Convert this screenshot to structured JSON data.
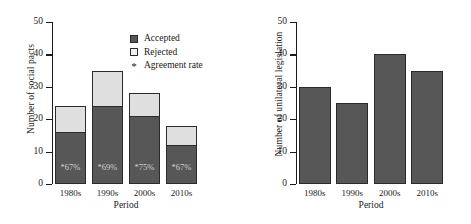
{
  "chart_data": [
    {
      "type": "bar",
      "panel": "left",
      "title": "",
      "xlabel": "Period",
      "ylabel": "Number of social pacts",
      "categories": [
        "1980s",
        "1990s",
        "2000s",
        "2010s"
      ],
      "ylim": [
        0,
        50
      ],
      "yticks": [
        0,
        10,
        20,
        30,
        40,
        50
      ],
      "ytick_labels": [
        "0",
        "10",
        "20",
        "30",
        "40",
        "50"
      ],
      "grid": false,
      "stacked": true,
      "series": [
        {
          "name": "Accepted",
          "values": [
            16,
            24,
            21,
            12
          ],
          "color": "#575757"
        },
        {
          "name": "Rejected",
          "values": [
            8,
            11,
            7,
            6
          ],
          "color": "#dfdfdf"
        }
      ],
      "totals": [
        24,
        35,
        28,
        18
      ],
      "annotations": [
        "*67%",
        "*69%",
        "*75%",
        "*67%"
      ],
      "legend": {
        "position": "upper-right",
        "entries": [
          {
            "label": "Accepted",
            "marker": "filled-square",
            "color": "#575757"
          },
          {
            "label": "Rejected",
            "marker": "open-square",
            "color": "#f2f2f2"
          },
          {
            "label": "Agreement rate",
            "marker": "star",
            "color": "#1a1a1a"
          }
        ]
      }
    },
    {
      "type": "bar",
      "panel": "right",
      "title": "",
      "xlabel": "Period",
      "ylabel": "Number of unilateral legislation",
      "categories": [
        "1980s",
        "1990s",
        "2000s",
        "2010s"
      ],
      "ylim": [
        0,
        50
      ],
      "yticks": [
        0,
        10,
        20,
        30,
        40,
        50
      ],
      "ytick_labels": [
        "0",
        "10",
        "20",
        "30",
        "40",
        "50"
      ],
      "grid": false,
      "stacked": false,
      "series": [
        {
          "name": "Unilateral legislation",
          "values": [
            30,
            25,
            40,
            35
          ],
          "color": "#575757"
        }
      ]
    }
  ]
}
